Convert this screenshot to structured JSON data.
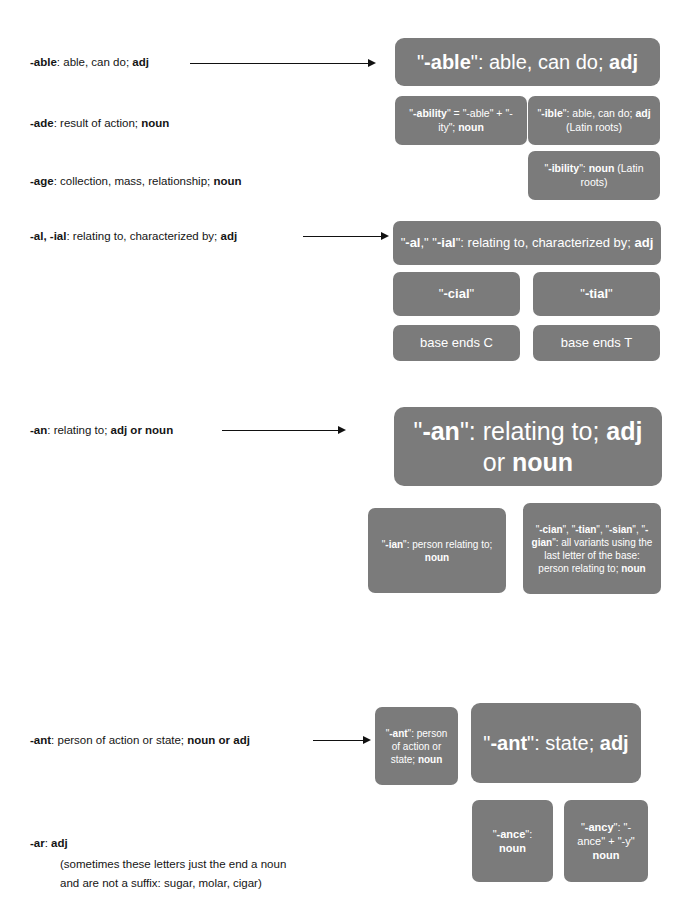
{
  "entries": [
    {
      "id": "able",
      "prefix": "-able",
      "rest": ": able, can do; ",
      "tail_bold": "adj"
    },
    {
      "id": "ade",
      "prefix": "-ade",
      "rest": ": result of action; ",
      "tail_bold": "noun"
    },
    {
      "id": "age",
      "prefix": "-age",
      "rest": ": collection, mass, relationship; ",
      "tail_bold": "noun"
    },
    {
      "id": "al-ial",
      "prefix": "-al, -ial",
      "rest": ": relating to, characterized by; ",
      "tail_bold": "adj"
    },
    {
      "id": "an",
      "prefix": "-an",
      "rest": ": relating to; ",
      "tail_bold": "adj or noun"
    },
    {
      "id": "ant",
      "prefix": "-ant",
      "rest": ": person of action or state; ",
      "tail_bold": "noun or adj"
    },
    {
      "id": "ar",
      "prefix": "-ar",
      "rest": ": ",
      "tail_bold": "adj"
    }
  ],
  "ar_note": {
    "line1": "(sometimes these letters just the end a noun",
    "line2": "and are not a suffix: sugar, molar, cigar)"
  },
  "boxes": {
    "able_main": {
      "label": "\"-able\": able, can do; adj",
      "parts": [
        {
          "t": "\"",
          "b": false
        },
        {
          "t": "-able",
          "b": true
        },
        {
          "t": "\": able, can do; ",
          "b": false
        },
        {
          "t": "adj",
          "b": true
        }
      ]
    },
    "ability": {
      "label": "\"-ability\" = \"-able\" + \"-ity\"; noun",
      "parts": [
        {
          "t": "\"",
          "b": false
        },
        {
          "t": "-ability",
          "b": true
        },
        {
          "t": "\" = \"-able\" + \"-ity\"; ",
          "b": false
        },
        {
          "t": "noun",
          "b": true
        }
      ]
    },
    "ible": {
      "label": "\"-ible\": able, can do; adj (Latin roots)",
      "parts": [
        {
          "t": "\"",
          "b": false
        },
        {
          "t": "-ible",
          "b": true
        },
        {
          "t": "\": able, can do; ",
          "b": false
        },
        {
          "t": "adj",
          "b": true
        },
        {
          "t": " (Latin roots)",
          "b": false
        }
      ]
    },
    "ibility": {
      "label": "\"-ibility\": noun (Latin roots)",
      "parts": [
        {
          "t": "\"",
          "b": false
        },
        {
          "t": "-ibility",
          "b": true
        },
        {
          "t": "\": ",
          "b": false
        },
        {
          "t": "noun",
          "b": true
        },
        {
          "t": " (Latin roots)",
          "b": false
        }
      ]
    },
    "al_main": {
      "label": "\"-al,\" \"-ial\": relating to, characterized by; adj",
      "parts": [
        {
          "t": "\"",
          "b": false
        },
        {
          "t": "-al",
          "b": true
        },
        {
          "t": ",\" \"",
          "b": false
        },
        {
          "t": "-ial",
          "b": true
        },
        {
          "t": "\": relating to, characterized by; ",
          "b": false
        },
        {
          "t": "adj",
          "b": true
        }
      ]
    },
    "cial": {
      "label": "\"-cial\"",
      "parts": [
        {
          "t": "\"",
          "b": false
        },
        {
          "t": "-cial",
          "b": true
        },
        {
          "t": "\"",
          "b": false
        }
      ]
    },
    "tial": {
      "label": "\"-tial\"",
      "parts": [
        {
          "t": "\"",
          "b": false
        },
        {
          "t": "-tial",
          "b": true
        },
        {
          "t": "\"",
          "b": false
        }
      ]
    },
    "base_c": {
      "label": "base ends C",
      "parts": [
        {
          "t": "base ends C",
          "b": false
        }
      ]
    },
    "base_t": {
      "label": "base ends T",
      "parts": [
        {
          "t": "base ends T",
          "b": false
        }
      ]
    },
    "an_main": {
      "label": "\"-an\": relating to; adj or noun",
      "parts": [
        {
          "t": "\"",
          "b": false
        },
        {
          "t": "-an",
          "b": true
        },
        {
          "t": "\": relating to; ",
          "b": false
        },
        {
          "t": "adj",
          "b": true
        },
        {
          "t": " or ",
          "b": false
        },
        {
          "t": "noun",
          "b": true
        }
      ]
    },
    "ian": {
      "label": "\"-ian\": person relating to; noun",
      "parts": [
        {
          "t": "\"",
          "b": false
        },
        {
          "t": "-ian",
          "b": true
        },
        {
          "t": "\": person relating to; ",
          "b": false
        },
        {
          "t": "noun",
          "b": true
        }
      ]
    },
    "cian_variants": {
      "label": "\"-cian\", \"-tian\", \"-sian\", \"-gian\": all variants using the last letter of the base: person relating to; noun",
      "parts": [
        {
          "t": "\"",
          "b": false
        },
        {
          "t": "-cian",
          "b": true
        },
        {
          "t": "\", \"",
          "b": false
        },
        {
          "t": "-tian",
          "b": true
        },
        {
          "t": "\", \"",
          "b": false
        },
        {
          "t": "-sian",
          "b": true
        },
        {
          "t": "\", \"",
          "b": false
        },
        {
          "t": "-gian",
          "b": true
        },
        {
          "t": "\": all variants using the last letter of the base: person relating to; ",
          "b": false
        },
        {
          "t": "noun",
          "b": true
        }
      ]
    },
    "ant_person": {
      "label": "\"-ant\": person of action or state; noun",
      "parts": [
        {
          "t": "\"",
          "b": false
        },
        {
          "t": "-ant",
          "b": true
        },
        {
          "t": "\": person of action or state; ",
          "b": false
        },
        {
          "t": "noun",
          "b": true
        }
      ]
    },
    "ant_state": {
      "label": "\"-ant\": state; adj",
      "parts": [
        {
          "t": "\"",
          "b": false
        },
        {
          "t": "-ant",
          "b": true
        },
        {
          "t": "\": state; ",
          "b": false
        },
        {
          "t": "adj",
          "b": true
        }
      ]
    },
    "ance": {
      "label": "\"-ance\": noun",
      "parts": [
        {
          "t": "\"",
          "b": false
        },
        {
          "t": "-ance",
          "b": true
        },
        {
          "t": "\": ",
          "b": false
        },
        {
          "t": "noun",
          "b": true
        }
      ]
    },
    "ancy": {
      "label": "\"-ancy\": \"-ance\" + \"-y\" noun",
      "parts": [
        {
          "t": "\"",
          "b": false
        },
        {
          "t": "-ancy",
          "b": true
        },
        {
          "t": "\": \"-ance\" + \"-y\" ",
          "b": false
        },
        {
          "t": "noun",
          "b": true
        }
      ]
    }
  },
  "colors": {
    "box_fill": "#7b7b7b",
    "box_text": "#ffffff",
    "body_text": "#151515",
    "arrow": "#111111",
    "background": "#ffffff"
  }
}
